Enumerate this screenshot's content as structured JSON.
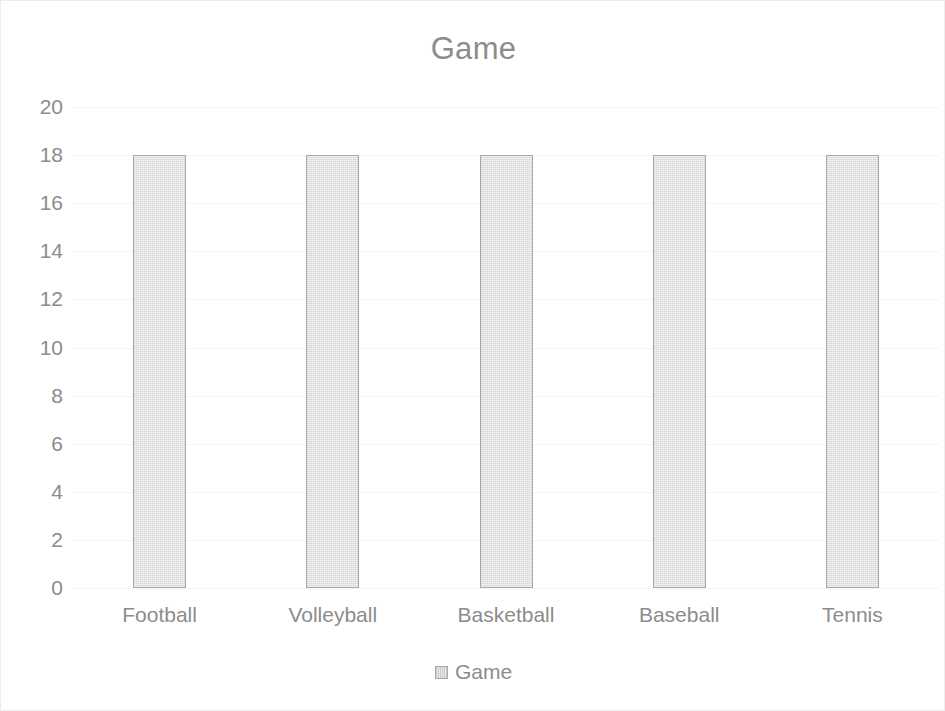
{
  "chart_data": {
    "type": "bar",
    "title": "Game",
    "categories": [
      "Football",
      "Volleyball",
      "Basketball",
      "Baseball",
      "Tennis"
    ],
    "values": [
      18,
      18,
      18,
      18,
      18
    ],
    "series": [
      {
        "name": "Game",
        "values": [
          18,
          18,
          18,
          18,
          18
        ]
      }
    ],
    "xlabel": "",
    "ylabel": "",
    "ylim": [
      0,
      20
    ],
    "ytick_step": 2,
    "yticks": [
      20,
      18,
      16,
      14,
      12,
      10,
      8,
      6,
      4,
      2,
      0
    ],
    "ytick_labels": [
      "20",
      "18",
      "16",
      "14",
      "12",
      "10",
      "8",
      "6",
      "4",
      "2",
      "0"
    ],
    "grid": true,
    "grid_axis": "y",
    "legend": true,
    "legend_position": "bottom",
    "legend_entries": [
      {
        "label": "Game",
        "swatch": "bar-swatch"
      }
    ],
    "colors": {
      "bar_fill": "#dcdcdc",
      "bar_border": "#a8a8a8",
      "text": "#8c8c8c",
      "gridline": "#ececec",
      "frame": "#ededed",
      "background": "#ffffff"
    }
  }
}
